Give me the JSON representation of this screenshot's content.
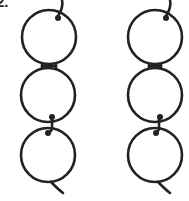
{
  "figure": {
    "label": "2.",
    "stroke_color": "#222222",
    "background": "#ffffff",
    "chains": [
      {
        "name": "left-chain",
        "rings": [
          {
            "cx": 49,
            "cy": 37,
            "r": 27
          },
          {
            "cx": 48,
            "cy": 95,
            "r": 27
          },
          {
            "cx": 48,
            "cy": 155,
            "r": 27
          }
        ]
      },
      {
        "name": "right-chain",
        "rings": [
          {
            "cx": 155,
            "cy": 37,
            "r": 27
          },
          {
            "cx": 155,
            "cy": 95,
            "r": 27
          },
          {
            "cx": 155,
            "cy": 155,
            "r": 27
          }
        ]
      }
    ]
  }
}
